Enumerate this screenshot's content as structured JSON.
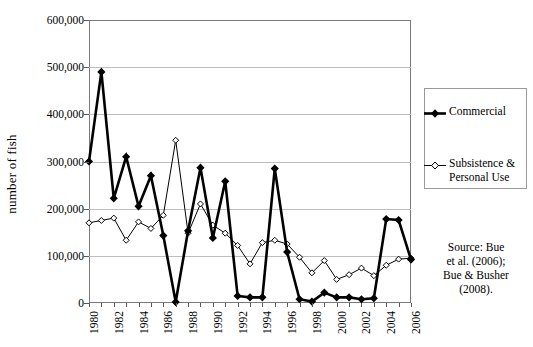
{
  "chart_data": {
    "type": "line",
    "title": "",
    "xlabel": "",
    "ylabel": "number of fish",
    "x": [
      1980,
      1981,
      1982,
      1983,
      1984,
      1985,
      1986,
      1987,
      1988,
      1989,
      1990,
      1991,
      1992,
      1993,
      1994,
      1995,
      1996,
      1997,
      1998,
      1999,
      2000,
      2001,
      2002,
      2003,
      2004,
      2005,
      2006
    ],
    "xlim": [
      1980,
      2006
    ],
    "ylim": [
      0,
      600000
    ],
    "yticks": [
      0,
      100000,
      200000,
      300000,
      400000,
      500000,
      600000
    ],
    "ytick_labels": [
      "0",
      "100,000",
      "200,000",
      "300,000",
      "400,000",
      "500,000",
      "600,000"
    ],
    "xtick_values": [
      1980,
      1982,
      1984,
      1986,
      1988,
      1990,
      1992,
      1994,
      1996,
      1998,
      2000,
      2002,
      2004,
      2006
    ],
    "xtick_labels": [
      "1980",
      "1982",
      "1984",
      "1986",
      "1988",
      "1990",
      "1992",
      "1994",
      "1996",
      "1998",
      "2000",
      "2002",
      "2004",
      "2006"
    ],
    "grid": "horizontal",
    "legend_position": "right",
    "series": [
      {
        "name": "Commercial",
        "marker": "filled-diamond",
        "color": "#000000",
        "line_width": 2.6,
        "values": [
          300000,
          490000,
          222000,
          310000,
          205000,
          270000,
          143000,
          2000,
          153000,
          287000,
          138000,
          258000,
          15000,
          12000,
          12000,
          285000,
          108000,
          8000,
          3000,
          22000,
          12000,
          12000,
          8000,
          10000,
          178000,
          176000,
          92000
        ]
      },
      {
        "name": "Subsistence &\nPersonal Use",
        "marker": "open-diamond",
        "color": "#000000",
        "line_width": 1,
        "values": [
          170000,
          175000,
          180000,
          133000,
          172000,
          158000,
          186000,
          345000,
          148000,
          210000,
          165000,
          148000,
          122000,
          83000,
          128000,
          133000,
          125000,
          97000,
          64000,
          90000,
          50000,
          60000,
          74000,
          58000,
          80000,
          93000,
          95000
        ]
      }
    ]
  },
  "legend": {
    "items": [
      {
        "label": "Commercial"
      },
      {
        "label": "Subsistence &\nPersonal Use"
      }
    ]
  },
  "source_note": "Source:  Bue\net al. (2006);\nBue & Busher\n(2008)."
}
